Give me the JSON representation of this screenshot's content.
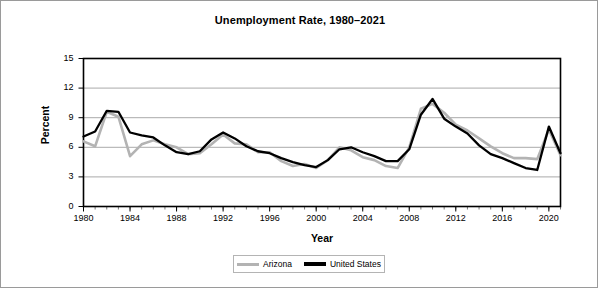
{
  "chart_data": {
    "type": "line",
    "title": "Unemployment Rate, 1980–2021",
    "xlabel": "Year",
    "ylabel": "Percent",
    "xlim": [
      1980,
      2021
    ],
    "ylim": [
      0,
      15
    ],
    "ytick_labels": [
      "0",
      "3",
      "6",
      "9",
      "12",
      "15"
    ],
    "ytick_values": [
      0,
      3,
      6,
      9,
      12,
      15
    ],
    "xtick_labels": [
      "1980",
      "1984",
      "1988",
      "1992",
      "1996",
      "2000",
      "2004",
      "2008",
      "2012",
      "2016",
      "2020"
    ],
    "xtick_values": [
      1980,
      1984,
      1988,
      1992,
      1996,
      2000,
      2004,
      2008,
      2012,
      2016,
      2020
    ],
    "minor_xticks_every": 1,
    "grid": "horizontal",
    "legend_position": "bottom-center",
    "colors": {
      "arizona": "#b3b3b3",
      "united_states": "#000000",
      "grid": "#a0a0a0",
      "frame": "#000000"
    },
    "x": [
      1980,
      1981,
      1982,
      1983,
      1984,
      1985,
      1986,
      1987,
      1988,
      1989,
      1990,
      1991,
      1992,
      1993,
      1994,
      1995,
      1996,
      1997,
      1998,
      1999,
      2000,
      2001,
      2002,
      2003,
      2004,
      2005,
      2006,
      2007,
      2008,
      2009,
      2010,
      2011,
      2012,
      2013,
      2014,
      2015,
      2016,
      2017,
      2018,
      2019,
      2020,
      2021
    ],
    "series": [
      {
        "name": "Arizona",
        "color": "#b3b3b3",
        "values": [
          6.6,
          6.1,
          9.6,
          9.1,
          5.1,
          6.3,
          6.7,
          6.3,
          6.0,
          5.3,
          5.4,
          6.3,
          7.3,
          6.4,
          6.3,
          5.5,
          5.5,
          4.6,
          4.1,
          4.3,
          3.9,
          4.7,
          6.0,
          5.7,
          5.0,
          4.7,
          4.1,
          3.9,
          6.0,
          9.9,
          10.4,
          9.5,
          8.3,
          7.7,
          6.9,
          6.1,
          5.4,
          4.9,
          4.9,
          4.8,
          7.8,
          5.2
        ]
      },
      {
        "name": "United States",
        "color": "#000000",
        "values": [
          7.1,
          7.6,
          9.7,
          9.6,
          7.5,
          7.2,
          7.0,
          6.2,
          5.5,
          5.3,
          5.6,
          6.8,
          7.5,
          6.9,
          6.1,
          5.6,
          5.4,
          4.9,
          4.5,
          4.2,
          4.0,
          4.7,
          5.8,
          6.0,
          5.5,
          5.1,
          4.6,
          4.6,
          5.8,
          9.3,
          10.9,
          8.9,
          8.1,
          7.4,
          6.2,
          5.3,
          4.9,
          4.4,
          3.9,
          3.7,
          8.1,
          5.4
        ]
      }
    ]
  },
  "legend": {
    "entries": [
      {
        "label": "Arizona"
      },
      {
        "label": "United States"
      }
    ]
  }
}
